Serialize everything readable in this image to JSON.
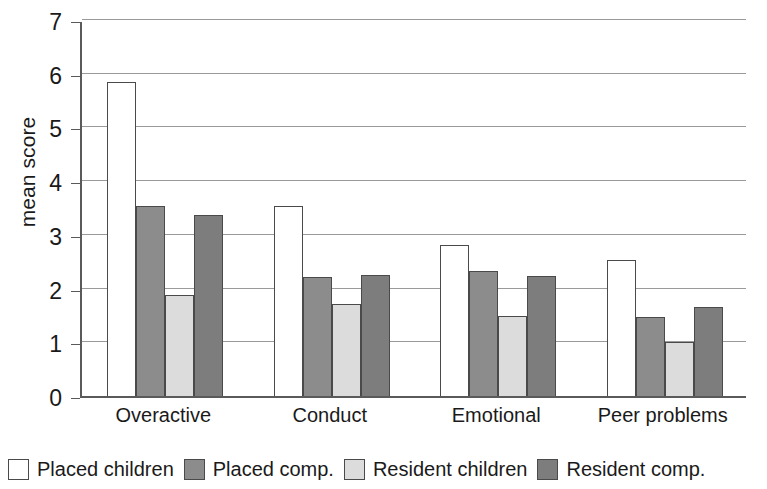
{
  "chart_data": {
    "type": "bar",
    "title": "",
    "xlabel": "",
    "ylabel": "mean score",
    "ylim": [
      0,
      7
    ],
    "ytick_values": [
      0,
      1,
      2,
      3,
      4,
      5,
      6,
      7
    ],
    "ytick_labels": [
      "0",
      "1",
      "2",
      "3",
      "4",
      "5",
      "6",
      "7"
    ],
    "grid": true,
    "legend_position": "bottom",
    "categories": [
      "Overactive",
      "Conduct",
      "Emotional",
      "Peer problems"
    ],
    "series": [
      {
        "name": "Placed children",
        "color": "#ffffff",
        "values": [
          5.85,
          3.54,
          2.82,
          2.54
        ]
      },
      {
        "name": "Placed comp.",
        "color": "#8c8c8c",
        "values": [
          3.54,
          2.21,
          2.32,
          1.48
        ]
      },
      {
        "name": "Resident children",
        "color": "#dcdcdc",
        "values": [
          1.88,
          1.72,
          1.49,
          1.0
        ]
      },
      {
        "name": "Resident comp.",
        "color": "#7d7d7d",
        "values": [
          3.37,
          2.25,
          2.23,
          1.66
        ]
      }
    ]
  },
  "colors": {
    "axis": "#5a5a5a",
    "gridline": "#9a9a9a",
    "bar_outline": "#4a4a4a",
    "text": "#1a1a1a",
    "background": "#ffffff"
  }
}
